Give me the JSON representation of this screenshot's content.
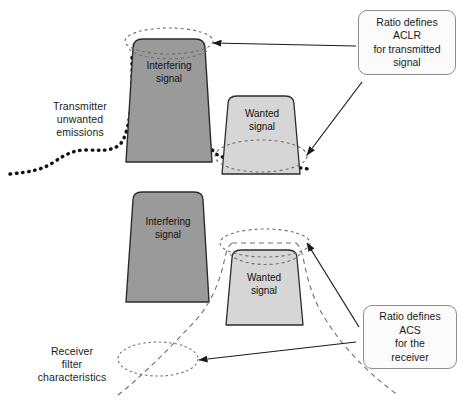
{
  "figure": {
    "colors": {
      "interfering_fill": "#9a9a9a",
      "wanted_fill": "#d6d6d6",
      "shape_stroke": "#2b2b2b",
      "emission_dots": "#111111",
      "filter_dash": "#6f6f6f",
      "ellipse_dash": "#6f6f6f",
      "callout_border": "#8e8e8e",
      "callout_fill": "#fbfbfb",
      "arrow": "#1a1a1a",
      "text": "#1a1a1a",
      "background": "#ffffff"
    }
  },
  "top_panel": {
    "interfering_signal_label": "Interfering\nsignal",
    "wanted_signal_label": "Wanted\nsignal",
    "transmitter_label": "Transmitter\nunwanted\nemissions",
    "callout_aclr": "Ratio defines\nACLR\nfor transmitted\nsignal"
  },
  "bottom_panel": {
    "interfering_signal_label": "Interfering\nsignal",
    "wanted_signal_label": "Wanted\nsignal",
    "receiver_filter_label": "Receiver\nfilter\ncharacteristics",
    "callout_acs": "Ratio defines\nACS\nfor the\nreceiver"
  }
}
